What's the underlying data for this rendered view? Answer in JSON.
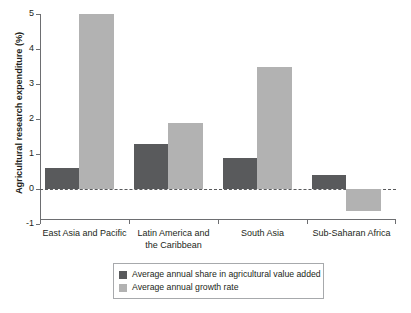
{
  "chart_data": {
    "type": "bar",
    "title": "",
    "xlabel": "",
    "ylabel": "Agricultural research expenditure (%)",
    "ylim": [
      -1,
      5
    ],
    "yticks": [
      -1,
      0,
      1,
      2,
      3,
      4,
      5
    ],
    "ytick_labels": [
      "-1",
      "0",
      "1",
      "2",
      "3",
      "4",
      "5"
    ],
    "grid": false,
    "zero_line": true,
    "legend_position": "bottom-center",
    "categories": [
      "East Asia and Pacific",
      "Latin America and the Caribbean",
      "South Asia",
      "Sub-Saharan Africa"
    ],
    "series": [
      {
        "name": "Average annual share in agricultural value added",
        "color": "#595a5c",
        "values": [
          0.6,
          1.3,
          0.9,
          0.4
        ]
      },
      {
        "name": "Average annual growth rate",
        "color": "#b2b2b2",
        "values": [
          5.0,
          1.9,
          3.5,
          -0.63
        ]
      }
    ]
  },
  "axis": {
    "y_title": "Agricultural research expenditure (%)",
    "y_ticks": [
      "5",
      "4",
      "3",
      "2",
      "1",
      "0",
      "-1"
    ],
    "x_categories": [
      {
        "line1": "East Asia and Pacific",
        "line2": ""
      },
      {
        "line1": "Latin America and",
        "line2": "the Caribbean"
      },
      {
        "line1": "South Asia",
        "line2": ""
      },
      {
        "line1": "Sub-Saharan Africa",
        "line2": ""
      }
    ]
  },
  "legend": {
    "items": [
      {
        "label": "Average annual share in agricultural value added",
        "color": "#595a5c"
      },
      {
        "label": "Average annual growth rate",
        "color": "#b2b2b2"
      }
    ]
  },
  "colors": {
    "share": "#595a5c",
    "growth": "#b2b2b2",
    "axis": "#6d6e71",
    "text": "#231f20"
  }
}
